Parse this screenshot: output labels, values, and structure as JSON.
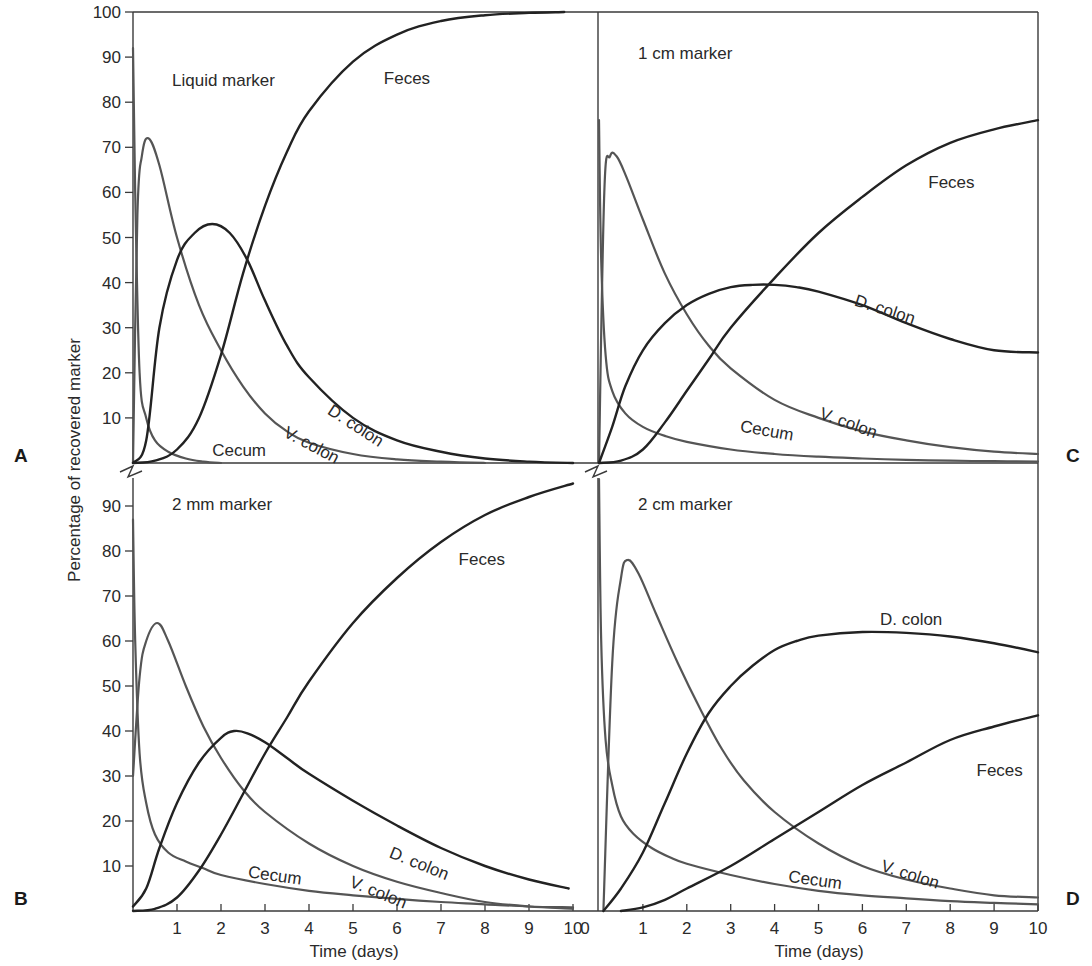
{
  "chart_data": [
    {
      "type": "line",
      "panel_letter": "A",
      "title": "Liquid marker",
      "xlabel": "",
      "ylabel": "Percentage of recovered marker",
      "xlim": [
        0,
        10
      ],
      "ylim": [
        0,
        100
      ],
      "yticks": [
        10,
        20,
        30,
        40,
        50,
        60,
        70,
        80,
        90,
        100
      ],
      "xticks": [],
      "series": [
        {
          "name": "Cecum",
          "color": "#555555",
          "x": [
            0,
            0.05,
            0.15,
            0.3,
            0.5,
            0.8,
            1.2,
            1.6,
            2.0
          ],
          "values": [
            92,
            60,
            20,
            10,
            5,
            2.5,
            1,
            0.3,
            0
          ]
        },
        {
          "name": "V. colon",
          "color": "#555555",
          "x": [
            0,
            0.1,
            0.2,
            0.35,
            0.6,
            1.0,
            1.5,
            2.0,
            2.5,
            3.0,
            3.5,
            4.0,
            5.0,
            6.0,
            7.0,
            8.0
          ],
          "values": [
            0,
            55,
            68,
            72,
            66,
            50,
            35,
            25,
            17,
            11,
            7,
            4.5,
            2,
            0.8,
            0.3,
            0
          ]
        },
        {
          "name": "D. colon",
          "color": "#222222",
          "x": [
            0,
            0.3,
            0.6,
            1.0,
            1.4,
            1.8,
            2.2,
            2.6,
            3.0,
            3.5,
            4.0,
            5.0,
            6.0,
            7.0,
            8.0,
            9.0,
            10.0
          ],
          "values": [
            0,
            5,
            30,
            45,
            51,
            53,
            51,
            45,
            36,
            26,
            19,
            10,
            5,
            2.5,
            1,
            0.3,
            0
          ]
        },
        {
          "name": "Feces",
          "color": "#222222",
          "x": [
            0,
            0.5,
            1.0,
            1.5,
            2.0,
            2.5,
            3.0,
            3.5,
            4.0,
            5.0,
            6.0,
            7.0,
            8.0,
            9.0,
            9.8
          ],
          "values": [
            0,
            0.5,
            3,
            10,
            24,
            42,
            57,
            69,
            78,
            89,
            95,
            98,
            99.3,
            99.8,
            100
          ]
        }
      ],
      "labels": [
        {
          "text": "Feces",
          "x": 5.7,
          "y": 84,
          "rotate": 0
        },
        {
          "text": "D. colon",
          "x": 4.4,
          "y": 11,
          "rotate": 33
        },
        {
          "text": "V. colon",
          "x": 3.4,
          "y": 6,
          "rotate": 28
        },
        {
          "text": "Cecum",
          "x": 1.8,
          "y": 1.5,
          "rotate": 0
        }
      ]
    },
    {
      "type": "line",
      "panel_letter": "C",
      "title": "1 cm marker",
      "xlabel": "",
      "ylabel": "",
      "xlim": [
        0,
        10
      ],
      "ylim": [
        0,
        100
      ],
      "xticks": [],
      "series": [
        {
          "name": "Cecum",
          "color": "#555555",
          "x": [
            0,
            0.05,
            0.15,
            0.3,
            0.6,
            1.0,
            1.5,
            2.0,
            3.0,
            4.0,
            5.0,
            6.0,
            7.0,
            8.0,
            9.0,
            10.0
          ],
          "values": [
            76,
            45,
            24,
            16,
            11,
            8,
            6,
            4.7,
            3,
            2,
            1.4,
            1,
            0.7,
            0.5,
            0.4,
            0.3
          ]
        },
        {
          "name": "V. colon",
          "color": "#555555",
          "x": [
            0,
            0.12,
            0.25,
            0.4,
            0.6,
            1.0,
            1.5,
            2.0,
            2.5,
            3.0,
            4.0,
            5.0,
            6.0,
            7.0,
            8.0,
            9.0,
            10.0
          ],
          "values": [
            0,
            60,
            68,
            68,
            64,
            54,
            42,
            33,
            26,
            21,
            14,
            10,
            7,
            5,
            3.5,
            2.5,
            2
          ]
        },
        {
          "name": "D. colon",
          "color": "#222222",
          "x": [
            0,
            0.3,
            0.6,
            1.0,
            1.5,
            2.0,
            2.5,
            3.0,
            3.5,
            4.0,
            4.5,
            5.0,
            6.0,
            7.0,
            8.0,
            9.0,
            10.0
          ],
          "values": [
            0,
            8,
            17,
            25,
            31,
            35,
            37.5,
            39,
            39.5,
            39.5,
            39,
            38,
            35,
            31,
            27.5,
            25,
            24.5
          ]
        },
        {
          "name": "Feces",
          "color": "#222222",
          "x": [
            0,
            0.5,
            1.0,
            1.5,
            2.0,
            2.5,
            3.0,
            4.0,
            5.0,
            6.0,
            7.0,
            8.0,
            9.0,
            10.0
          ],
          "values": [
            0,
            0.5,
            3,
            9,
            16,
            23,
            30,
            41,
            51,
            59,
            66,
            71,
            74,
            76
          ]
        }
      ],
      "labels": [
        {
          "text": "Feces",
          "x": 7.5,
          "y": 61,
          "rotate": 0
        },
        {
          "text": "D. colon",
          "x": 5.8,
          "y": 35,
          "rotate": 18
        },
        {
          "text": "V. colon",
          "x": 5.0,
          "y": 10,
          "rotate": 20
        },
        {
          "text": "Cecum",
          "x": 3.2,
          "y": 7,
          "rotate": 10
        }
      ]
    },
    {
      "type": "line",
      "panel_letter": "B",
      "title": "2 mm marker",
      "xlabel": "Time (days)",
      "ylabel": "Percentage of recovered marker",
      "xlim": [
        0,
        10
      ],
      "ylim": [
        0,
        100
      ],
      "yticks": [
        10,
        20,
        30,
        40,
        50,
        60,
        70,
        80,
        90
      ],
      "xticks": [
        1,
        2,
        3,
        4,
        5,
        6,
        7,
        8,
        9,
        10
      ],
      "series": [
        {
          "name": "Cecum",
          "color": "#555555",
          "x": [
            0,
            0.05,
            0.15,
            0.3,
            0.5,
            0.8,
            1.2,
            1.6,
            2.0,
            3.0,
            4.0,
            5.0,
            6.0,
            7.0,
            8.0,
            9.0,
            10.0
          ],
          "values": [
            87,
            60,
            35,
            24,
            17,
            13,
            11,
            9.5,
            8,
            6,
            4.5,
            3.5,
            2.7,
            2,
            1.5,
            1,
            0.8
          ]
        },
        {
          "name": "V. colon",
          "color": "#555555",
          "x": [
            0,
            0.15,
            0.3,
            0.55,
            0.8,
            1.2,
            1.6,
            2.0,
            2.5,
            3.0,
            4.0,
            5.0,
            6.0,
            7.0,
            8.0,
            9.0,
            10.0
          ],
          "values": [
            30,
            52,
            60,
            64,
            60,
            50,
            41,
            34,
            27,
            22,
            15,
            10,
            6.5,
            4,
            2,
            1,
            0.5
          ]
        },
        {
          "name": "D. colon",
          "color": "#222222",
          "x": [
            0,
            0.3,
            0.6,
            1.0,
            1.5,
            2.0,
            2.3,
            2.6,
            3.0,
            3.5,
            4.0,
            5.0,
            6.0,
            7.0,
            8.0,
            9.0,
            9.9
          ],
          "values": [
            1,
            5,
            14,
            24,
            33,
            38.5,
            40,
            39.5,
            37.5,
            34,
            30.5,
            24.5,
            19,
            14,
            10,
            7,
            5
          ]
        },
        {
          "name": "Feces",
          "color": "#222222",
          "x": [
            0,
            0.5,
            1.0,
            1.5,
            2.0,
            2.5,
            3.0,
            3.5,
            4.0,
            5.0,
            6.0,
            7.0,
            8.0,
            9.0,
            10.0
          ],
          "values": [
            0,
            0.5,
            3,
            9,
            17,
            26,
            35,
            43,
            51,
            64,
            74,
            82,
            88,
            92,
            95
          ]
        }
      ],
      "labels": [
        {
          "text": "Feces",
          "x": 7.4,
          "y": 77,
          "rotate": 0
        },
        {
          "text": "D. colon",
          "x": 5.8,
          "y": 12,
          "rotate": 22
        },
        {
          "text": "V. colon",
          "x": 4.9,
          "y": 5.5,
          "rotate": 22
        },
        {
          "text": "Cecum",
          "x": 2.6,
          "y": 7.5,
          "rotate": 8
        }
      ]
    },
    {
      "type": "line",
      "panel_letter": "D",
      "title": "2 cm marker",
      "xlabel": "Time (days)",
      "ylabel": "",
      "xlim": [
        0,
        10
      ],
      "ylim": [
        0,
        100
      ],
      "xticks": [
        0,
        1,
        2,
        3,
        4,
        5,
        6,
        7,
        8,
        9,
        10
      ],
      "series": [
        {
          "name": "Cecum",
          "color": "#555555",
          "x": [
            0,
            0.05,
            0.15,
            0.3,
            0.5,
            0.8,
            1.2,
            1.6,
            2.0,
            3.0,
            4.0,
            5.0,
            6.0,
            7.0,
            8.0,
            9.0,
            10.0
          ],
          "values": [
            96,
            60,
            38,
            28,
            21,
            17,
            14,
            12,
            10.5,
            8,
            6,
            4.5,
            3.5,
            2.8,
            2.2,
            1.8,
            1.5
          ]
        },
        {
          "name": "V. colon",
          "color": "#555555",
          "x": [
            0.1,
            0.3,
            0.5,
            0.65,
            0.9,
            1.3,
            1.8,
            2.3,
            2.8,
            3.3,
            4.0,
            5.0,
            6.0,
            7.0,
            8.0,
            9.0,
            10.0
          ],
          "values": [
            0,
            55,
            74,
            78,
            75,
            66,
            55,
            45,
            36,
            29,
            22,
            15,
            10,
            7,
            5,
            3.5,
            3
          ]
        },
        {
          "name": "D. colon",
          "color": "#222222",
          "x": [
            0.1,
            0.5,
            1.0,
            1.5,
            2.0,
            2.5,
            3.0,
            3.5,
            4.0,
            4.5,
            5.0,
            6.0,
            7.0,
            8.0,
            9.0,
            10.0
          ],
          "values": [
            0,
            5,
            13,
            24,
            35,
            44,
            50,
            54.5,
            58,
            60,
            61.2,
            62,
            61.8,
            61,
            59.5,
            57.5
          ]
        },
        {
          "name": "Feces",
          "color": "#222222",
          "x": [
            0.5,
            1.0,
            1.5,
            2.0,
            3.0,
            4.0,
            5.0,
            6.0,
            7.0,
            8.0,
            9.0,
            10.0
          ],
          "values": [
            0,
            0.8,
            2.5,
            5,
            10,
            16,
            22,
            28,
            33,
            38,
            41,
            43.5
          ]
        }
      ],
      "labels": [
        {
          "text": "D. colon",
          "x": 6.4,
          "y": 63.5,
          "rotate": 0
        },
        {
          "text": "Feces",
          "x": 8.6,
          "y": 30,
          "rotate": 0
        },
        {
          "text": "V. colon",
          "x": 6.4,
          "y": 9,
          "rotate": 18
        },
        {
          "text": "Cecum",
          "x": 4.3,
          "y": 6.5,
          "rotate": 8
        }
      ]
    }
  ],
  "figure": {
    "ylabel": "Percentage of recovered marker",
    "xlabel": "Time (days)",
    "panel_letters": [
      "A",
      "B",
      "C",
      "D"
    ],
    "panel_titles": [
      "Liquid marker",
      "1 cm marker",
      "2 mm marker",
      "2 cm marker"
    ]
  }
}
